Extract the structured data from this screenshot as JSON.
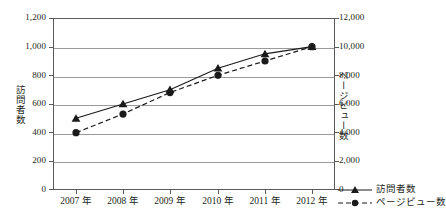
{
  "chart_data": {
    "type": "line",
    "title": "",
    "xlabel": "",
    "categories": [
      "2007 年",
      "2008 年",
      "2009 年",
      "2010 年",
      "2011 年",
      "2012 年"
    ],
    "grid": true,
    "legend_position": "bottom-right",
    "axes": {
      "left": {
        "label": "訪問者数",
        "ylim": [
          0,
          1200
        ],
        "step": 200,
        "ticks": [
          "0",
          "200",
          "400",
          "600",
          "800",
          "1,000",
          "1,200"
        ]
      },
      "right": {
        "label": "ページビュー数",
        "ylim": [
          0,
          12000
        ],
        "step": 2000,
        "ticks": [
          "0",
          "2,000",
          "4,000",
          "6,000",
          "8,000",
          "10,000",
          "12,000"
        ]
      }
    },
    "series": [
      {
        "name": "訪問者数",
        "axis": "left",
        "marker": "triangle",
        "line_style": "solid",
        "color": "#1a1a1a",
        "values": [
          500,
          600,
          700,
          850,
          950,
          1000
        ]
      },
      {
        "name": "ページビュー数",
        "axis": "right",
        "marker": "circle",
        "line_style": "dashed",
        "color": "#1a1a1a",
        "values": [
          4000,
          5300,
          6800,
          8000,
          9000,
          10000
        ]
      }
    ]
  },
  "legend": {
    "items": [
      {
        "label": "訪問者数",
        "marker": "triangle",
        "line_style": "solid"
      },
      {
        "label": "ページビュー数",
        "marker": "circle",
        "line_style": "dashed"
      }
    ]
  },
  "colors": {
    "ink": "#231f20",
    "grid": "#9a9a9a",
    "frame": "#5a5a5a",
    "series": "#1a1a1a"
  }
}
